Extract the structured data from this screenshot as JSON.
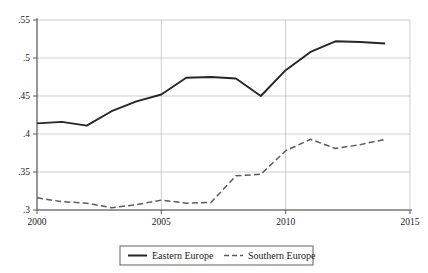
{
  "chart_data": {
    "type": "line",
    "title": "",
    "subtitle": "",
    "xlabel": "",
    "ylabel": "",
    "xlim": [
      2000,
      2015
    ],
    "ylim": [
      0.3,
      0.55
    ],
    "grid": true,
    "legend_position": "bottom-center",
    "x": [
      2000,
      2001,
      2002,
      2003,
      2004,
      2005,
      2006,
      2007,
      2008,
      2009,
      2010,
      2011,
      2012,
      2013,
      2014
    ],
    "xticks": [
      2000,
      2005,
      2010,
      2015
    ],
    "xtick_labels": [
      "2000",
      "2005",
      "2010",
      "2015"
    ],
    "yticks": [
      0.3,
      0.35,
      0.4,
      0.45,
      0.5,
      0.55
    ],
    "ytick_labels": [
      ".3",
      ".35",
      ".4",
      ".45",
      ".5",
      ".55"
    ],
    "series": [
      {
        "name": "Eastern Europe",
        "style": "solid",
        "color": "#262626",
        "values": [
          0.414,
          0.416,
          0.411,
          0.43,
          0.443,
          0.452,
          0.474,
          0.475,
          0.473,
          0.45,
          0.484,
          0.508,
          0.522,
          0.521,
          0.519
        ]
      },
      {
        "name": "Southern Europe",
        "style": "dashed",
        "color": "#5c5c5c",
        "values": [
          0.316,
          0.311,
          0.309,
          0.303,
          0.307,
          0.313,
          0.309,
          0.31,
          0.345,
          0.347,
          0.378,
          0.393,
          0.381,
          0.386,
          0.393
        ]
      }
    ],
    "legend": [
      {
        "label": "Eastern Europe",
        "style": "solid"
      },
      {
        "label": "Southern Europe",
        "style": "dashed"
      }
    ]
  }
}
